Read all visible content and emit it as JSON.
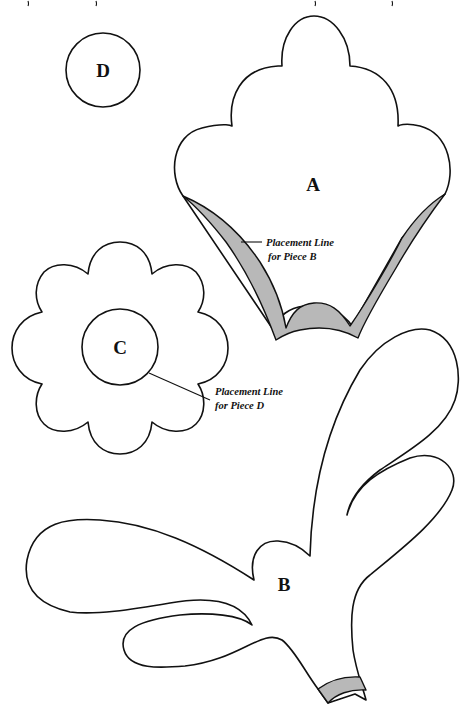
{
  "pieces": {
    "a": {
      "label": "A"
    },
    "b": {
      "label": "B"
    },
    "c": {
      "label": "C"
    },
    "d": {
      "label": "D"
    }
  },
  "notes": {
    "placement_b": {
      "line1": "Placement Line",
      "line2": "for Piece B"
    },
    "placement_d": {
      "line1": "Placement Line",
      "line2": "for Piece D"
    }
  },
  "colors": {
    "outline": "#111111",
    "shade": "#b8b8b8",
    "background": "#ffffff"
  }
}
